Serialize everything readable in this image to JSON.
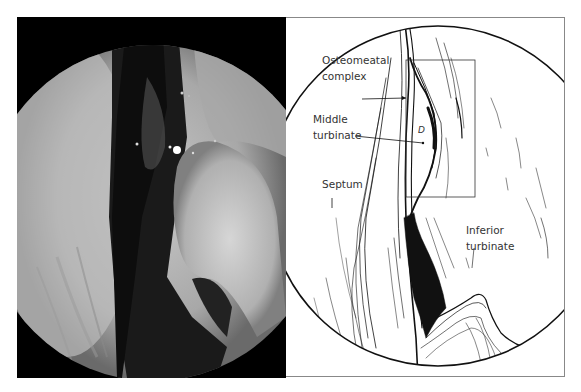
{
  "figure": {
    "left_panel": {
      "type": "endoscopic-photograph",
      "description": "Endoscopic view of nasal cavity"
    },
    "right_panel": {
      "type": "line-drawing",
      "labels": {
        "osteomeatal_line1": "Osteomeatal",
        "osteomeatal_line2": "complex",
        "middle_line1": "Middle",
        "middle_line2": "turbinate",
        "septum": "Septum",
        "inferior_line1": "Inferior",
        "inferior_line2": "turbinate",
        "d_mark": "D"
      }
    }
  }
}
